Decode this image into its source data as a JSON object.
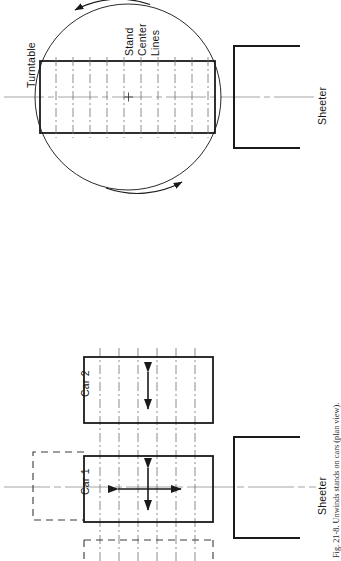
{
  "figure": {
    "caption": "Fig. 21-8.  Unwinds stands on cars (plan view).",
    "orientation": "rotated-90-ccw",
    "view": "plan view"
  },
  "top_diagram": {
    "name": "turntable-assembly",
    "labels": {
      "turntable": "Turntable",
      "stand_center_lines": [
        "Stand",
        "Center",
        "Lines"
      ],
      "sheeter": "Sheeter"
    },
    "elements": {
      "turntable_circle": "circle",
      "stand_rectangle": "rectangle",
      "rotation_arrows": 2,
      "stand_center_line_count": 10,
      "center_cross": "+"
    }
  },
  "bottom_diagram": {
    "name": "cars-assembly",
    "labels": {
      "car_2": "Car 2",
      "car_1": "Car 1",
      "sheeter": "Sheeter"
    },
    "elements": {
      "car_rect_count": 2,
      "dashed_outline_count": 2,
      "stand_center_line_count": 6,
      "car1_motion": "four-way",
      "car2_motion": "two-way-vertical"
    }
  },
  "colors": {
    "line": "#1a1a1a",
    "thin_line": "#555555",
    "center_line": "#8c8c8c",
    "background": "#ffffff"
  }
}
